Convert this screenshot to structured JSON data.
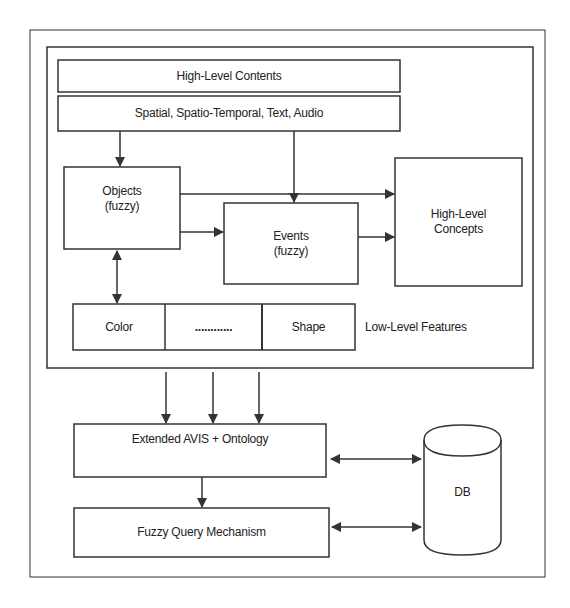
{
  "diagram": {
    "high_level_contents": "High-Level Contents",
    "content_types": "Spatial, Spatio-Temporal, Text, Audio",
    "objects": {
      "line1": "Objects",
      "line2": "(fuzzy)"
    },
    "events": {
      "line1": "Events",
      "line2": "(fuzzy)"
    },
    "concepts": {
      "line1": "High-Level",
      "line2": "Concepts"
    },
    "features": {
      "cells": [
        "Color",
        "............",
        "Shape"
      ],
      "label": "Low-Level Features"
    },
    "extended_avis": "Extended AVIS + Ontology",
    "fuzzy_query": "Fuzzy Query Mechanism",
    "db": "DB"
  },
  "colors": {
    "stroke": "#333333",
    "background": "#ffffff"
  }
}
